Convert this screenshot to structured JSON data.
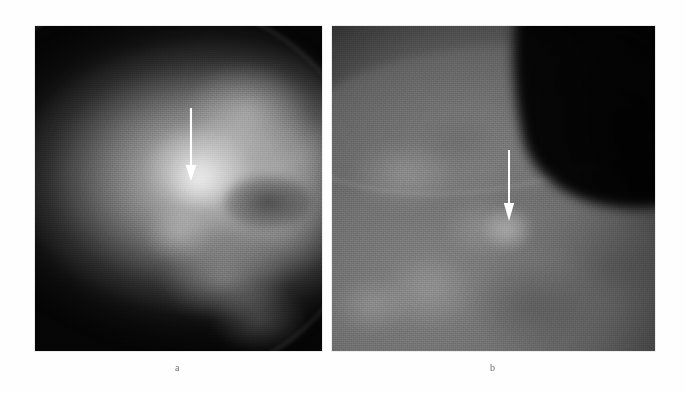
{
  "figure": {
    "kind": "mammogram-figure",
    "background_color": "#ffffff",
    "panel_count": 2,
    "panels": [
      {
        "id": "a",
        "caption": "a",
        "modality": "mammogram",
        "view": "craniocaudal",
        "frame": {
          "x": 35,
          "y": 26,
          "width": 287,
          "height": 325
        },
        "background_color": "#050505",
        "tissue_color": "#b4b4b4",
        "annotation": {
          "type": "arrow",
          "color": "#ffffff",
          "direction": "down",
          "x": 190,
          "y_start": 108,
          "y_tip": 180,
          "points_to": "focal-density"
        }
      },
      {
        "id": "b",
        "caption": "b",
        "modality": "mammogram",
        "view": "mediolateral-oblique",
        "frame": {
          "x": 332,
          "y": 26,
          "width": 323,
          "height": 325
        },
        "background_color": "#070707",
        "tissue_color": "#7d7d7d",
        "annotation": {
          "type": "arrow",
          "color": "#ffffff",
          "direction": "down",
          "x": 509,
          "y_start": 150,
          "y_tip": 219,
          "points_to": "focal-density"
        }
      }
    ]
  }
}
